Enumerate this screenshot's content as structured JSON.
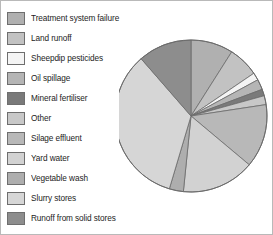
{
  "chart_data": {
    "type": "pie",
    "title": "",
    "legend_position": "left",
    "grid": false,
    "units": "percent",
    "start_angle_deg": 0,
    "direction": "clockwise",
    "categories": [
      "Treatment system failure",
      "Land runoff",
      "Sheepdip pesticides",
      "Oil spillage",
      "Mineral fertiliser",
      "Other",
      "Silage effluent",
      "Yard water",
      "Vegetable wash",
      "Slurry stores",
      "Runoff from solid stores"
    ],
    "values": [
      9.0,
      6.5,
      1.6,
      2.2,
      1.4,
      1.9,
      13.5,
      15.5,
      3.0,
      34.0,
      11.4
    ],
    "colors": [
      "#b0b0b0",
      "#c2c2c2",
      "#f4f4f4",
      "#b5b5b5",
      "#7a7a7a",
      "#c8c8c8",
      "#b8b8b8",
      "#d2d2d2",
      "#aeaeae",
      "#d6d6d6",
      "#8d8d8d"
    ],
    "slice_border_color": "#6b6b6b",
    "xlabel": "",
    "ylabel": ""
  },
  "legend": {
    "items": [
      {
        "label": "Treatment system failure",
        "color": "#b0b0b0"
      },
      {
        "label": "Land runoff",
        "color": "#c2c2c2"
      },
      {
        "label": "Sheepdip pesticides",
        "color": "#f4f4f4"
      },
      {
        "label": "Oil spillage",
        "color": "#b5b5b5"
      },
      {
        "label": "Mineral fertiliser",
        "color": "#7a7a7a"
      },
      {
        "label": "Other",
        "color": "#c8c8c8"
      },
      {
        "label": "Silage effluent",
        "color": "#b8b8b8"
      },
      {
        "label": "Yard water",
        "color": "#d2d2d2"
      },
      {
        "label": "Vegetable wash",
        "color": "#aeaeae"
      },
      {
        "label": "Slurry stores",
        "color": "#d6d6d6"
      },
      {
        "label": "Runoff from solid stores",
        "color": "#8d8d8d"
      }
    ]
  }
}
